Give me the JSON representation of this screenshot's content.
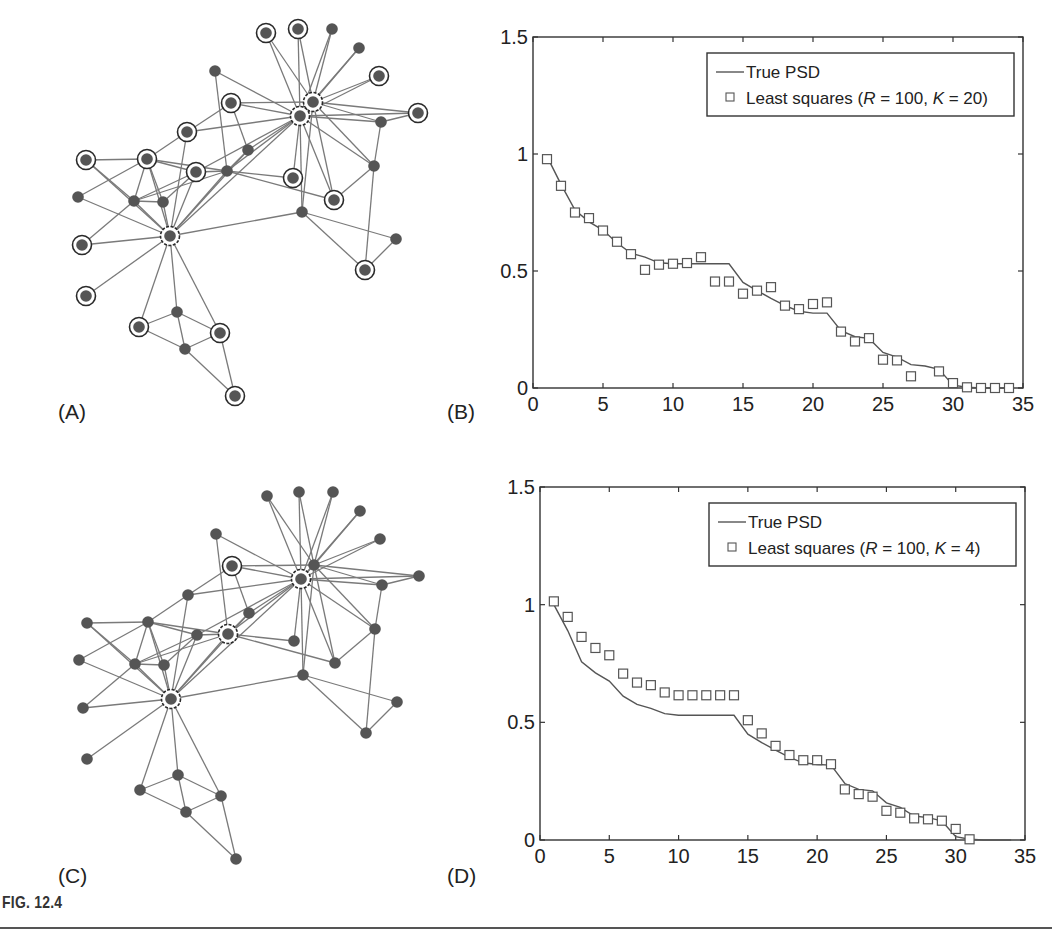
{
  "figure": {
    "caption": "FIG. 12.4",
    "panels": {
      "A": "(A)",
      "B": "(B)",
      "C": "(C)",
      "D": "(D)"
    }
  },
  "graphs": {
    "nodes": [
      [
        266,
        33
      ],
      [
        298,
        29
      ],
      [
        332,
        29
      ],
      [
        359,
        48
      ],
      [
        379,
        76
      ],
      [
        313,
        102
      ],
      [
        300,
        116
      ],
      [
        418,
        113
      ],
      [
        381,
        122
      ],
      [
        215,
        71
      ],
      [
        231,
        103
      ],
      [
        187,
        132
      ],
      [
        248,
        150
      ],
      [
        86,
        160
      ],
      [
        147,
        159
      ],
      [
        196,
        172
      ],
      [
        227,
        171
      ],
      [
        293,
        178
      ],
      [
        374,
        166
      ],
      [
        78,
        197
      ],
      [
        134,
        201
      ],
      [
        163,
        202
      ],
      [
        334,
        200
      ],
      [
        302,
        212
      ],
      [
        170,
        236
      ],
      [
        82,
        245
      ],
      [
        396,
        239
      ],
      [
        365,
        270
      ],
      [
        86,
        296
      ],
      [
        177,
        312
      ],
      [
        139,
        327
      ],
      [
        220,
        333
      ],
      [
        185,
        349
      ],
      [
        235,
        396
      ]
    ],
    "edges": [
      [
        7,
        1
      ],
      [
        7,
        2
      ],
      [
        7,
        3
      ],
      [
        7,
        4
      ],
      [
        7,
        5
      ],
      [
        7,
        8
      ],
      [
        7,
        9
      ],
      [
        7,
        10
      ],
      [
        7,
        11
      ],
      [
        7,
        12
      ],
      [
        7,
        13
      ],
      [
        7,
        17
      ],
      [
        7,
        18
      ],
      [
        7,
        23
      ],
      [
        7,
        24
      ],
      [
        7,
        19
      ],
      [
        7,
        25
      ],
      [
        7,
        16
      ],
      [
        7,
        6
      ],
      [
        6,
        1
      ],
      [
        6,
        2
      ],
      [
        6,
        3
      ],
      [
        6,
        4
      ],
      [
        6,
        5
      ],
      [
        6,
        8
      ],
      [
        6,
        11
      ],
      [
        6,
        9
      ],
      [
        6,
        23
      ],
      [
        6,
        19
      ],
      [
        6,
        24
      ],
      [
        25,
        12
      ],
      [
        25,
        15
      ],
      [
        25,
        16
      ],
      [
        25,
        17
      ],
      [
        25,
        13
      ],
      [
        25,
        21
      ],
      [
        25,
        22
      ],
      [
        25,
        20
      ],
      [
        25,
        26
      ],
      [
        25,
        29
      ],
      [
        25,
        30
      ],
      [
        25,
        31
      ],
      [
        25,
        32
      ],
      [
        25,
        24
      ],
      [
        25,
        14
      ],
      [
        10,
        17
      ],
      [
        11,
        13
      ],
      [
        11,
        12
      ],
      [
        12,
        15
      ],
      [
        14,
        15
      ],
      [
        14,
        21
      ],
      [
        15,
        16
      ],
      [
        15,
        17
      ],
      [
        15,
        21
      ],
      [
        15,
        22
      ],
      [
        16,
        17
      ],
      [
        16,
        21
      ],
      [
        17,
        13
      ],
      [
        17,
        21
      ],
      [
        17,
        18
      ],
      [
        17,
        23
      ],
      [
        20,
        15
      ],
      [
        21,
        22
      ],
      [
        21,
        26
      ],
      [
        9,
        8
      ],
      [
        9,
        19
      ],
      [
        19,
        23
      ],
      [
        19,
        28
      ],
      [
        24,
        27
      ],
      [
        24,
        28
      ],
      [
        27,
        28
      ],
      [
        30,
        31
      ],
      [
        30,
        32
      ],
      [
        31,
        33
      ],
      [
        32,
        33
      ],
      [
        33,
        34
      ],
      [
        32,
        34
      ],
      [
        30,
        33
      ],
      [
        22,
        16
      ]
    ],
    "A": {
      "name": "graph-A",
      "selected_nodes": [
        1,
        2,
        5,
        6,
        7,
        8,
        11,
        12,
        14,
        15,
        16,
        18,
        23,
        25,
        26,
        28,
        29,
        31,
        32,
        34
      ],
      "dashed_nodes": [
        6,
        7,
        25
      ]
    },
    "C": {
      "name": "graph-C",
      "selected_nodes": [
        7,
        11,
        17,
        25
      ],
      "dashed_nodes": [
        7,
        17,
        25
      ]
    }
  },
  "chart_data": [
    {
      "panel": "B",
      "type": "line",
      "title": "",
      "xlabel": "",
      "ylabel": "",
      "xlim": [
        0,
        35
      ],
      "ylim": [
        0,
        1.5
      ],
      "xticks": [
        0,
        5,
        10,
        15,
        20,
        25,
        30,
        35
      ],
      "yticks": [
        0,
        0.5,
        1,
        1.5
      ],
      "ytick_labels": [
        "0",
        "0.5",
        "1",
        "1.5"
      ],
      "grid": false,
      "legend_position": "top-right",
      "series": [
        {
          "name": "True PSD",
          "style": "line",
          "x": [
            1,
            2,
            3,
            4,
            5,
            6,
            7,
            8,
            9,
            10,
            11,
            12,
            13,
            14,
            15,
            16,
            17,
            18,
            19,
            20,
            21,
            22,
            23,
            24,
            25,
            26,
            27,
            28,
            29,
            30,
            31,
            32,
            33,
            34
          ],
          "y": [
            0.99,
            0.87,
            0.76,
            0.71,
            0.675,
            0.62,
            0.576,
            0.559,
            0.535,
            0.531,
            0.531,
            0.531,
            0.531,
            0.531,
            0.451,
            0.416,
            0.383,
            0.352,
            0.328,
            0.32,
            0.32,
            0.245,
            0.219,
            0.212,
            0.152,
            0.132,
            0.1,
            0.094,
            0.08,
            0.012,
            0.003,
            0,
            0,
            0
          ]
        },
        {
          "name": "Least squares (R = 100, K = 20)",
          "legend_parts": [
            "Least squares (",
            "R",
            " = 100, ",
            "K",
            " = 20)"
          ],
          "style": "square-markers",
          "x": [
            1,
            2,
            3,
            4,
            5,
            6,
            7,
            8,
            9,
            10,
            11,
            12,
            13,
            14,
            15,
            16,
            17,
            18,
            19,
            20,
            21,
            22,
            23,
            24,
            25,
            26,
            27,
            29,
            30,
            31,
            32,
            33,
            34
          ],
          "y": [
            0.978,
            0.864,
            0.75,
            0.726,
            0.673,
            0.625,
            0.572,
            0.505,
            0.527,
            0.531,
            0.534,
            0.559,
            0.455,
            0.455,
            0.403,
            0.416,
            0.431,
            0.352,
            0.337,
            0.359,
            0.366,
            0.241,
            0.199,
            0.213,
            0.121,
            0.118,
            0.05,
            0.071,
            0.021,
            0.003,
            0,
            0,
            0
          ]
        }
      ]
    },
    {
      "panel": "D",
      "type": "line",
      "title": "",
      "xlabel": "",
      "ylabel": "",
      "xlim": [
        0,
        35
      ],
      "ylim": [
        0,
        1.5
      ],
      "xticks": [
        0,
        5,
        10,
        15,
        20,
        25,
        30,
        35
      ],
      "yticks": [
        0,
        0.5,
        1,
        1.5
      ],
      "ytick_labels": [
        "0",
        "0.5",
        "1",
        "1.5"
      ],
      "grid": false,
      "legend_position": "top-right",
      "series": [
        {
          "name": "True PSD",
          "style": "line",
          "x": [
            1,
            2,
            3,
            4,
            5,
            6,
            7,
            8,
            9,
            10,
            11,
            12,
            13,
            14,
            15,
            16,
            17,
            18,
            19,
            20,
            21,
            22,
            23,
            24,
            25,
            26,
            27,
            28,
            29,
            30,
            31,
            32,
            33,
            34
          ],
          "y": [
            1.0,
            0.89,
            0.757,
            0.71,
            0.675,
            0.611,
            0.576,
            0.559,
            0.537,
            0.53,
            0.53,
            0.53,
            0.53,
            0.53,
            0.45,
            0.414,
            0.382,
            0.351,
            0.328,
            0.321,
            0.318,
            0.24,
            0.215,
            0.209,
            0.158,
            0.139,
            0.102,
            0.095,
            0.081,
            0.014,
            0.003,
            0,
            0,
            0
          ]
        },
        {
          "name": "Least squares (R = 100, K = 4)",
          "legend_parts": [
            "Least squares (",
            "R",
            " = 100, ",
            "K",
            " = 4)"
          ],
          "style": "square-markers",
          "x": [
            1,
            2,
            3,
            4,
            5,
            6,
            7,
            8,
            9,
            10,
            11,
            12,
            13,
            14,
            15,
            16,
            17,
            18,
            19,
            20,
            21,
            22,
            23,
            24,
            25,
            26,
            27,
            28,
            29,
            30,
            31
          ],
          "y": [
            1.014,
            0.948,
            0.863,
            0.816,
            0.785,
            0.707,
            0.669,
            0.658,
            0.627,
            0.615,
            0.615,
            0.615,
            0.615,
            0.615,
            0.509,
            0.453,
            0.4,
            0.361,
            0.339,
            0.339,
            0.322,
            0.215,
            0.195,
            0.184,
            0.124,
            0.116,
            0.092,
            0.088,
            0.082,
            0.047,
            0.003
          ]
        }
      ]
    }
  ]
}
